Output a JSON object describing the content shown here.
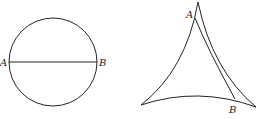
{
  "figure_left": {
    "shape": "circle",
    "diameter_label_start": "A",
    "diameter_label_end": "B",
    "stroke_color": "#222222"
  },
  "figure_right": {
    "shape": "curvilinear-triangle",
    "point_label_top": "A",
    "point_label_bottom": "B",
    "stroke_color": "#222222"
  }
}
